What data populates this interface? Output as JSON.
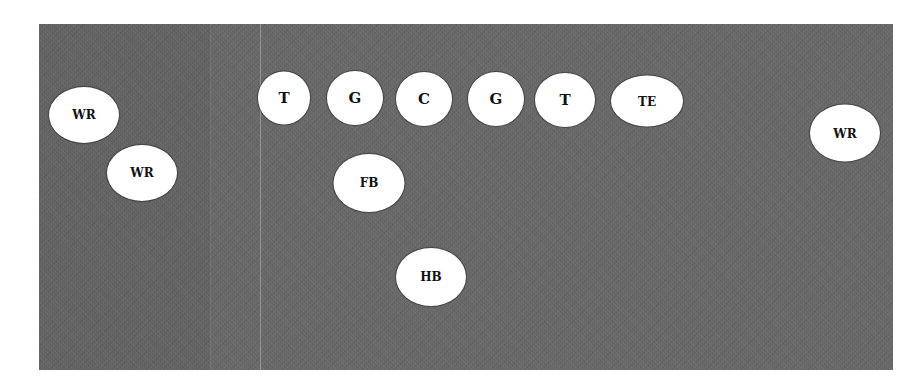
{
  "diagram": {
    "type": "football-formation",
    "field": {
      "color": "#676767",
      "line_of_scrimmage_color": "#9a9a9a"
    },
    "players": [
      {
        "id": "wr-left-1",
        "label": "WR",
        "x": 84,
        "y": 115,
        "w": 70,
        "h": 56,
        "size": "sm"
      },
      {
        "id": "wr-left-2",
        "label": "WR",
        "x": 142,
        "y": 173,
        "w": 70,
        "h": 56,
        "size": "sm"
      },
      {
        "id": "lt",
        "label": "T",
        "x": 284,
        "y": 98,
        "w": 52,
        "h": 53,
        "size": "lg"
      },
      {
        "id": "lg",
        "label": "G",
        "x": 355,
        "y": 98,
        "w": 56,
        "h": 54,
        "size": "lg"
      },
      {
        "id": "c",
        "label": "C",
        "x": 424,
        "y": 99,
        "w": 56,
        "h": 54,
        "size": "lg"
      },
      {
        "id": "rg",
        "label": "G",
        "x": 496,
        "y": 99,
        "w": 56,
        "h": 54,
        "size": "lg"
      },
      {
        "id": "rt",
        "label": "T",
        "x": 565,
        "y": 100,
        "w": 60,
        "h": 54,
        "size": "lg"
      },
      {
        "id": "te",
        "label": "TE",
        "x": 647,
        "y": 101,
        "w": 72,
        "h": 51,
        "size": "sm"
      },
      {
        "id": "wr-right",
        "label": "WR",
        "x": 845,
        "y": 133,
        "w": 70,
        "h": 57,
        "size": "sm"
      },
      {
        "id": "fb",
        "label": "FB",
        "x": 369,
        "y": 183,
        "w": 71,
        "h": 58,
        "size": "sm"
      },
      {
        "id": "hb",
        "label": "HB",
        "x": 431,
        "y": 277,
        "w": 70,
        "h": 58,
        "size": "sm"
      }
    ]
  }
}
